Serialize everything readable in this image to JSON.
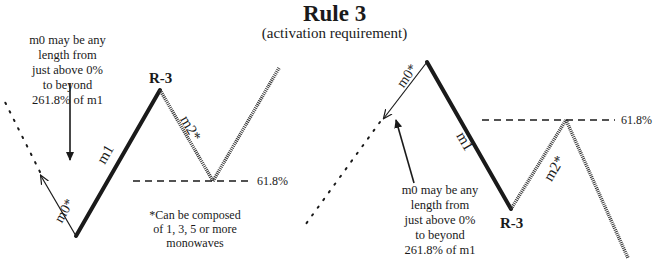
{
  "title": "Rule 3",
  "subtitle": "(activation requirement)",
  "left_diagram": {
    "note_lines": [
      "m0 may be any",
      "length from",
      "just above 0%",
      "to beyond",
      "261.8% of m1"
    ],
    "peak_label": "R-3",
    "m0_label": "m0*",
    "m1_label": "m1",
    "m2_label": "m2*",
    "retrace_label": "61.8%",
    "footnote_lines": [
      "*Can be composed",
      "of 1, 3, 5 or more",
      "monowaves"
    ]
  },
  "right_diagram": {
    "note_lines": [
      "m0 may be any",
      "length from",
      "just above 0%",
      "to beyond",
      "261.8% of m1"
    ],
    "trough_label": "R-3",
    "m0_label": "m0*",
    "m1_label": "m1",
    "m2_label": "m2*",
    "retrace_label": "61.8%"
  },
  "colors": {
    "line": "#1a1a1a",
    "hatched": "#3a3a3a",
    "background": "#ffffff"
  }
}
